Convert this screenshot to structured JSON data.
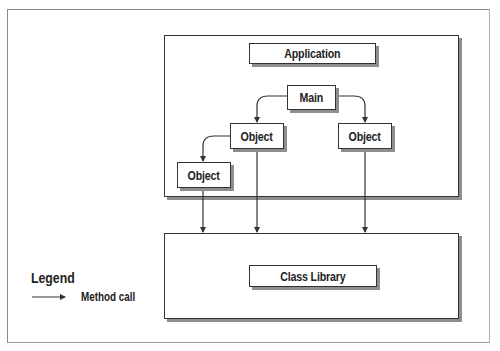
{
  "diagram": {
    "application": {
      "label": "Application"
    },
    "main": {
      "label": "Main"
    },
    "objects": [
      {
        "label": "Object",
        "position": "middle-left"
      },
      {
        "label": "Object",
        "position": "right"
      },
      {
        "label": "Object",
        "position": "lower-left"
      }
    ],
    "class_library": {
      "label": "Class Library"
    },
    "edges": [
      {
        "from": "Main",
        "to": "Object (middle-left)",
        "type": "method call"
      },
      {
        "from": "Main",
        "to": "Object (right)",
        "type": "method call"
      },
      {
        "from": "Object (middle-left)",
        "to": "Object (lower-left)",
        "type": "method call"
      },
      {
        "from": "Object (lower-left)",
        "to": "Class Library",
        "type": "method call"
      },
      {
        "from": "Object (middle-left)",
        "to": "Class Library",
        "type": "method call"
      },
      {
        "from": "Object (right)",
        "to": "Class Library",
        "type": "method call"
      }
    ]
  },
  "legend": {
    "title": "Legend",
    "items": [
      {
        "symbol": "arrow-icon",
        "label": "Method call"
      }
    ]
  },
  "colors": {
    "line": "#333333",
    "shadow": "#8e8e8e",
    "background": "#ffffff"
  }
}
